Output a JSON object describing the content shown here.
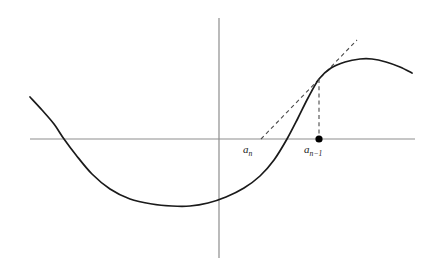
{
  "figure": {
    "background_color": "#ffffff",
    "width": 433,
    "height": 271
  },
  "axes": {
    "x_axis": {
      "name": "horizontal-axis",
      "color": "#8d8d8d",
      "x_start": 30,
      "x_end": 415,
      "y": 139
    },
    "y_axis": {
      "name": "vertical-axis",
      "color": "#8d8d8d",
      "x": 219,
      "y_start": 18,
      "y_end": 258
    },
    "tick_labels": [],
    "axis_titles": {
      "x": "",
      "y": ""
    },
    "grid": false
  },
  "labels": {
    "a_n": {
      "base": "a",
      "subscript": "n",
      "x": 243,
      "y": 144
    },
    "a_n_minus_1": {
      "base": "a",
      "subscript": "n−1",
      "x": 304,
      "y": 144
    }
  },
  "markers": {
    "root_estimate_point": {
      "label": "a_{n-1}",
      "x": 319,
      "y": 139,
      "radius": 3.6,
      "color": "#000000"
    }
  },
  "chart_data": {
    "type": "line",
    "title": "",
    "xlabel": "",
    "ylabel": "",
    "grid": false,
    "legend": null,
    "xlim": [
      30,
      415
    ],
    "ylim": [
      258,
      18
    ],
    "series": [
      {
        "name": "f(x)",
        "style": "solid",
        "color": "#1a1a1a",
        "points": [
          [
            30,
            97
          ],
          [
            42,
            110
          ],
          [
            54,
            124
          ],
          [
            64,
            139
          ],
          [
            76,
            155
          ],
          [
            92,
            174
          ],
          [
            110,
            189
          ],
          [
            130,
            199
          ],
          [
            152,
            204
          ],
          [
            172,
            206
          ],
          [
            190,
            206
          ],
          [
            208,
            203
          ],
          [
            226,
            197
          ],
          [
            244,
            188
          ],
          [
            260,
            176
          ],
          [
            274,
            160
          ],
          [
            287,
            139
          ],
          [
            298,
            118
          ],
          [
            308,
            98
          ],
          [
            319,
            79
          ],
          [
            331,
            68
          ],
          [
            345,
            62
          ],
          [
            360,
            59
          ],
          [
            372,
            59
          ],
          [
            386,
            62
          ],
          [
            400,
            67
          ],
          [
            412,
            73
          ]
        ],
        "features": {
          "left_endpoint": [
            30,
            97
          ],
          "left_root": [
            64,
            139
          ],
          "local_minimum": [
            190,
            206
          ],
          "inflection_root": [
            287,
            139
          ],
          "tangency_point": [
            319,
            79
          ],
          "local_maximum": [
            372,
            59
          ],
          "right_endpoint": [
            412,
            73
          ]
        }
      },
      {
        "name": "tangent at a_{n-1}",
        "style": "dashed",
        "color": "#4a4a4a",
        "points": [
          [
            261,
            139
          ],
          [
            357,
            40
          ]
        ],
        "x_intercept": [
          261,
          139
        ]
      },
      {
        "name": "vertical drop at a_{n-1}",
        "style": "dashed",
        "color": "#4a4a4a",
        "points": [
          [
            319,
            79
          ],
          [
            319,
            139
          ]
        ]
      }
    ]
  }
}
